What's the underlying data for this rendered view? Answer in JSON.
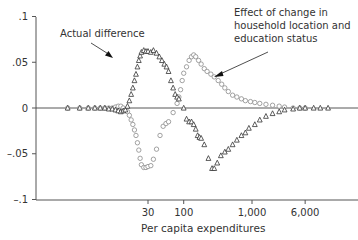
{
  "chart_data": {
    "type": "scatter",
    "title": "",
    "xlabel": "Per capita expenditures",
    "ylabel": "",
    "x_scale": "log",
    "x_ticks": [
      {
        "value": 30,
        "label": "30"
      },
      {
        "value": 100,
        "label": "100"
      },
      {
        "value": 1000,
        "label": "1,000"
      },
      {
        "value": 6000,
        "label": "6,000"
      }
    ],
    "y_ticks": [
      {
        "value": 0.1,
        "label": ".1"
      },
      {
        "value": 0.05,
        "label": ".05"
      },
      {
        "value": 0,
        "label": "0"
      },
      {
        "value": -0.05,
        "label": "–.05"
      },
      {
        "value": -0.1,
        "label": "–.1"
      }
    ],
    "ylim": [
      -0.1,
      0.1
    ],
    "grid": false,
    "zero_line": true,
    "annotations": [
      {
        "text": "Actual difference",
        "target_series": "Actual difference"
      },
      {
        "text": "Effect of change in household location and education status",
        "lines": [
          "Effect of change in",
          "household location and",
          "education status"
        ],
        "target_series": "Effect of change in household location and education status"
      }
    ],
    "series": [
      {
        "name": "Actual difference",
        "marker": "triangle",
        "points": [
          [
            2,
            0.0
          ],
          [
            3,
            0.0
          ],
          [
            4,
            0.0
          ],
          [
            5,
            0.0
          ],
          [
            6,
            0.0
          ],
          [
            7,
            0.0
          ],
          [
            8,
            -0.001
          ],
          [
            9,
            -0.001
          ],
          [
            10,
            -0.002
          ],
          [
            11,
            -0.003
          ],
          [
            12,
            -0.004
          ],
          [
            13,
            -0.003
          ],
          [
            14,
            -0.002
          ],
          [
            15,
            0.002
          ],
          [
            16,
            0.008
          ],
          [
            17,
            0.015
          ],
          [
            18,
            0.022
          ],
          [
            19,
            0.03
          ],
          [
            20,
            0.037
          ],
          [
            21,
            0.045
          ],
          [
            22,
            0.052
          ],
          [
            23,
            0.057
          ],
          [
            24,
            0.061
          ],
          [
            26,
            0.063
          ],
          [
            28,
            0.062
          ],
          [
            30,
            0.062
          ],
          [
            33,
            0.061
          ],
          [
            36,
            0.063
          ],
          [
            40,
            0.06
          ],
          [
            44,
            0.056
          ],
          [
            48,
            0.052
          ],
          [
            52,
            0.048
          ],
          [
            56,
            0.045
          ],
          [
            60,
            0.04
          ],
          [
            65,
            0.03
          ],
          [
            70,
            0.022
          ],
          [
            75,
            0.015
          ],
          [
            80,
            0.012
          ],
          [
            85,
            0.01
          ],
          [
            100,
            0.0
          ],
          [
            110,
            -0.012
          ],
          [
            120,
            -0.015
          ],
          [
            130,
            -0.015
          ],
          [
            140,
            -0.018
          ],
          [
            150,
            -0.023
          ],
          [
            160,
            -0.03
          ],
          [
            170,
            -0.032
          ],
          [
            180,
            -0.033
          ],
          [
            200,
            -0.04
          ],
          [
            230,
            -0.055
          ],
          [
            260,
            -0.066
          ],
          [
            280,
            -0.066
          ],
          [
            310,
            -0.06
          ],
          [
            350,
            -0.052
          ],
          [
            400,
            -0.048
          ],
          [
            450,
            -0.045
          ],
          [
            520,
            -0.04
          ],
          [
            600,
            -0.035
          ],
          [
            700,
            -0.03
          ],
          [
            800,
            -0.027
          ],
          [
            900,
            -0.022
          ],
          [
            1100,
            -0.018
          ],
          [
            1300,
            -0.013
          ],
          [
            1600,
            -0.009
          ],
          [
            2000,
            -0.006
          ],
          [
            2500,
            -0.004
          ],
          [
            3000,
            -0.002
          ],
          [
            4000,
            -0.001
          ],
          [
            5000,
            0.0
          ],
          [
            6000,
            0.0
          ],
          [
            8000,
            0.0
          ],
          [
            10000,
            0.0
          ],
          [
            13000,
            0.0
          ]
        ]
      },
      {
        "name": "Effect of change in household location and education status",
        "marker": "circle",
        "points": [
          [
            2,
            0.0
          ],
          [
            3,
            0.0
          ],
          [
            4,
            0.0
          ],
          [
            5,
            0.0
          ],
          [
            6,
            0.0
          ],
          [
            7,
            0.0
          ],
          [
            8,
            0.0
          ],
          [
            9,
            0.0
          ],
          [
            10,
            0.001
          ],
          [
            11,
            0.002
          ],
          [
            12,
            0.002
          ],
          [
            13,
            0.0
          ],
          [
            15,
            -0.004
          ],
          [
            16,
            -0.008
          ],
          [
            17,
            -0.013
          ],
          [
            18,
            -0.018
          ],
          [
            19,
            -0.024
          ],
          [
            20,
            -0.03
          ],
          [
            21,
            -0.038
          ],
          [
            22,
            -0.046
          ],
          [
            23,
            -0.055
          ],
          [
            24,
            -0.062
          ],
          [
            26,
            -0.065
          ],
          [
            28,
            -0.065
          ],
          [
            30,
            -0.064
          ],
          [
            33,
            -0.063
          ],
          [
            36,
            -0.056
          ],
          [
            40,
            -0.045
          ],
          [
            45,
            -0.03
          ],
          [
            50,
            -0.02
          ],
          [
            55,
            -0.017
          ],
          [
            60,
            -0.015
          ],
          [
            70,
            -0.005
          ],
          [
            80,
            0.005
          ],
          [
            85,
            0.012
          ],
          [
            90,
            0.02
          ],
          [
            95,
            0.03
          ],
          [
            100,
            0.038
          ],
          [
            110,
            0.045
          ],
          [
            120,
            0.052
          ],
          [
            130,
            0.056
          ],
          [
            140,
            0.058
          ],
          [
            150,
            0.056
          ],
          [
            165,
            0.052
          ],
          [
            180,
            0.048
          ],
          [
            200,
            0.043
          ],
          [
            220,
            0.04
          ],
          [
            250,
            0.037
          ],
          [
            280,
            0.034
          ],
          [
            320,
            0.03
          ],
          [
            360,
            0.026
          ],
          [
            400,
            0.022
          ],
          [
            450,
            0.018
          ],
          [
            520,
            0.014
          ],
          [
            600,
            0.012
          ],
          [
            700,
            0.01
          ],
          [
            800,
            0.008
          ],
          [
            950,
            0.007
          ],
          [
            1100,
            0.006
          ],
          [
            1300,
            0.005
          ],
          [
            1600,
            0.004
          ],
          [
            2000,
            0.003
          ],
          [
            2500,
            0.002
          ],
          [
            3000,
            0.001
          ],
          [
            4000,
            0.0
          ],
          [
            5000,
            0.0
          ],
          [
            6000,
            0.0
          ]
        ]
      }
    ]
  }
}
